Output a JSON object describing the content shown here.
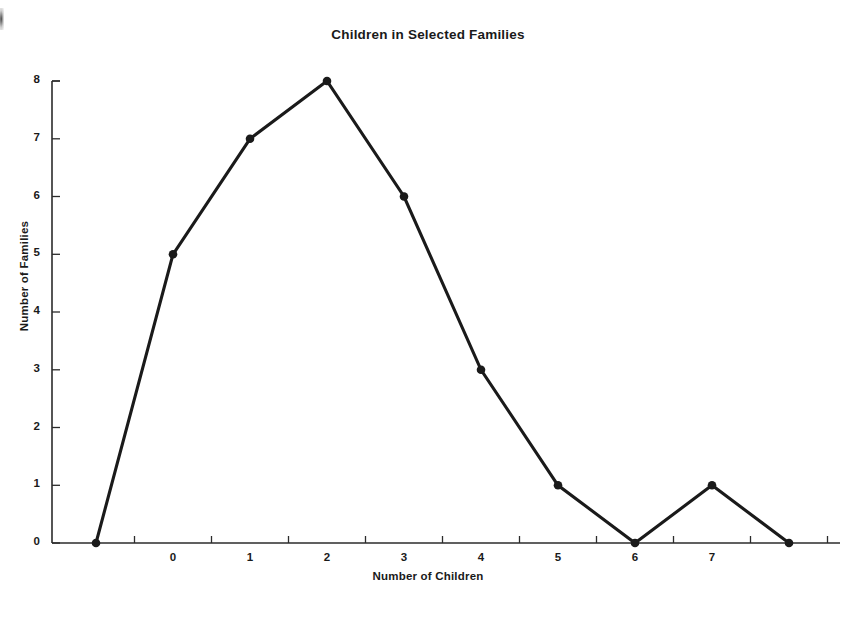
{
  "chart_data": {
    "type": "line",
    "title": "Children in Selected Families",
    "xlabel": "Number of Children",
    "ylabel": "Number of Families",
    "categories": [
      "0",
      "1",
      "2",
      "3",
      "4",
      "5",
      "6",
      "7"
    ],
    "x": [
      0,
      1,
      2,
      3,
      4,
      5,
      6,
      7
    ],
    "values": [
      5,
      7,
      8,
      6,
      3,
      1,
      0,
      1
    ],
    "series": [
      {
        "name": "Number of Families",
        "values": [
          5,
          7,
          8,
          6,
          3,
          1,
          0,
          1
        ]
      }
    ],
    "extra_endpoints": {
      "description": "Polyline is anchored at zero one step beyond each end of the labeled range",
      "left": {
        "x": -1,
        "y": 0
      },
      "right": {
        "x": 8,
        "y": 0
      }
    },
    "polyline_points": [
      {
        "x": -1,
        "y": 0
      },
      {
        "x": 0,
        "y": 5
      },
      {
        "x": 1,
        "y": 7
      },
      {
        "x": 2,
        "y": 8
      },
      {
        "x": 3,
        "y": 6
      },
      {
        "x": 4,
        "y": 3
      },
      {
        "x": 5,
        "y": 1
      },
      {
        "x": 6,
        "y": 0
      },
      {
        "x": 7,
        "y": 1
      },
      {
        "x": 8,
        "y": 0
      }
    ],
    "ylim": [
      0,
      8
    ],
    "xlim": [
      -1,
      8
    ],
    "y_ticks": [
      "0",
      "1",
      "2",
      "3",
      "4",
      "5",
      "6",
      "7",
      "8"
    ],
    "x_ticks": [
      "0",
      "1",
      "2",
      "3",
      "4",
      "5",
      "6",
      "7"
    ],
    "grid": false,
    "legend": false,
    "legend_position": "none",
    "marker": "filled-circle",
    "line_color": "#1a1a1a",
    "marker_color": "#1a1a1a",
    "background_color": "#ffffff"
  },
  "geometry": {
    "y_axis_x": 52,
    "baseline_y": 543,
    "top_y": 81,
    "unit_y": 57.75,
    "first_point_x": 96,
    "step_x": 77,
    "axis_right_x": 840
  }
}
